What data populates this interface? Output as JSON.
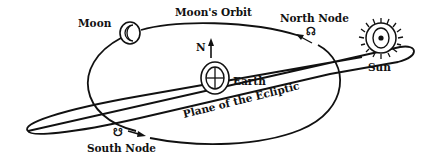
{
  "diagram": {
    "labels": {
      "moon": "Moon",
      "moons_orbit": "Moon's Orbit",
      "north_node": "North Node",
      "north": "N",
      "earth": "Earth",
      "sun": "Sun",
      "ecliptic": "Plane of the Ecliptic",
      "south_node": "South Node"
    },
    "symbols": {
      "north_node": "☊",
      "south_node": "☋",
      "moon": "crescent-moon-icon",
      "earth": "earth-cross-icon",
      "sun": "sun-rays-icon"
    },
    "colors": {
      "ink": "#111111",
      "background": "#ffffff"
    }
  }
}
